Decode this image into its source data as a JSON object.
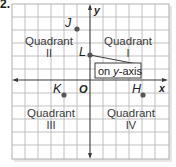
{
  "problem_number": "2.",
  "axes": {
    "x_label": "x",
    "y_label": "y",
    "origin_label": "O"
  },
  "quadrants": [
    {
      "word": "Quadrant",
      "numeral": "I"
    },
    {
      "word": "Quadrant",
      "numeral": "II"
    },
    {
      "word": "Quadrant",
      "numeral": "III"
    },
    {
      "word": "Quadrant",
      "numeral": "IV"
    }
  ],
  "points": [
    {
      "label": "J",
      "grid_x": -1,
      "grid_y": 4
    },
    {
      "label": "L",
      "grid_x": 0,
      "grid_y": 2
    },
    {
      "label": "K",
      "grid_x": -2,
      "grid_y": -1
    },
    {
      "label": "H",
      "grid_x": 4,
      "grid_y": -1
    }
  ],
  "callout": {
    "text_prefix": "on ",
    "text_var": "y",
    "text_suffix": "-axis"
  },
  "colors": {
    "grid": "#b9b9b9",
    "axis": "#3a3a3a",
    "point": "#555555"
  }
}
